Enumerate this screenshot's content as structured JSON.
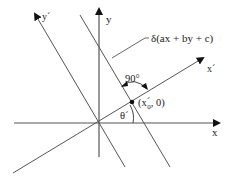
{
  "diagram": {
    "type": "coordinate-rotation",
    "axes": {
      "x": {
        "label": "x"
      },
      "y": {
        "label": "y"
      },
      "x_prime": {
        "label": "x´"
      },
      "y_prime": {
        "label": "y´"
      }
    },
    "line": {
      "label": "δ(ax + by + c)"
    },
    "point": {
      "label_open": "(x",
      "label_prime": "´",
      "label_sub": "0",
      "label_close": ", 0)"
    },
    "angles": {
      "right_angle": "90°",
      "theta": "θ´"
    },
    "colors": {
      "line": "#555555",
      "text": "#222222",
      "background": "#ffffff"
    }
  }
}
